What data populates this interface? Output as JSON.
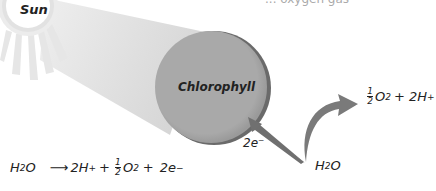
{
  "diagram": {
    "title_fragment": "... oxygen gas",
    "sun": {
      "label": "Sun"
    },
    "chlorophyll": {
      "label": "Chlorophyll",
      "fill": "#a8a8a8",
      "edge": "#6a6a6a"
    },
    "electron_label": "2e⁻",
    "water_source": {
      "main": "H",
      "sub": "2",
      "tail": "O"
    },
    "products": {
      "frac_num": "1",
      "frac_den": "2",
      "o": "O",
      "o_sub": "2",
      "plus": "+ 2H",
      "sup": "+"
    },
    "equation": {
      "reactant_main": "H",
      "reactant_sub": "2",
      "reactant_tail": "O",
      "arrow": "⟶",
      "p1": "2H",
      "p1_sup": "+",
      "plus1": "+",
      "frac_num": "1",
      "frac_den": "2",
      "o": "O",
      "o_sub": "2",
      "plus2": "+",
      "e": "2e",
      "e_sup": "−"
    },
    "colors": {
      "beam": "#d9d9d9",
      "arrow": "#7a7a7a",
      "sun_ring": "#dcdcdc",
      "sun_core": "#ffffff"
    }
  }
}
